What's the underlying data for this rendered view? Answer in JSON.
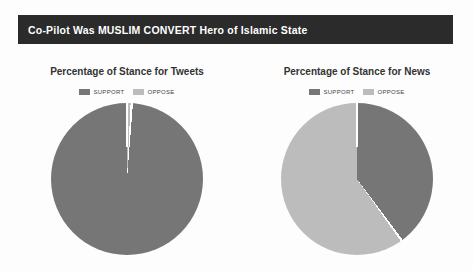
{
  "header": {
    "title": "Co-Pilot Was MUSLIM CONVERT Hero of Islamic State",
    "background": "#2b2b2b",
    "text_color": "#ffffff"
  },
  "chart_data": [
    {
      "type": "pie",
      "title": "Percentage of Stance for Tweets",
      "categories": [
        "SUPPORT",
        "OPPOSE"
      ],
      "values": [
        99,
        1
      ],
      "colors": [
        "#767676",
        "#bcbcbc"
      ],
      "legend_position": "top",
      "slice_border_color": "#ffffff",
      "start_angle": "12-o-clock",
      "note_units": "percent"
    },
    {
      "type": "pie",
      "title": "Percentage of Stance for News",
      "categories": [
        "SUPPORT",
        "OPPOSE"
      ],
      "values": [
        40,
        60
      ],
      "colors": [
        "#767676",
        "#bcbcbc"
      ],
      "legend_position": "top",
      "slice_border_color": "#ffffff",
      "start_angle": "12-o-clock",
      "note_units": "percent"
    }
  ]
}
